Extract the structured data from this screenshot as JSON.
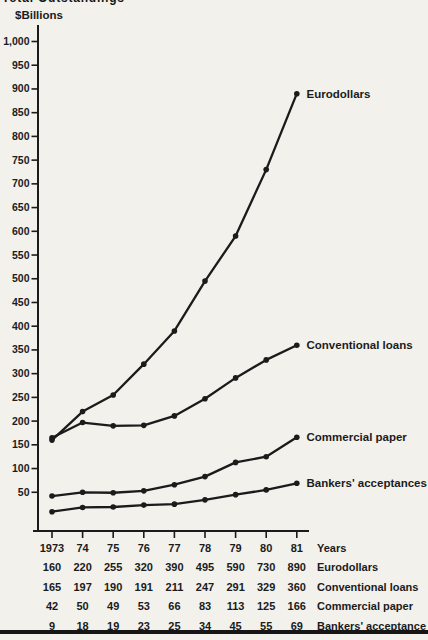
{
  "page": {
    "clipped_title": "Total Outstandings",
    "background_color": "#f2f1ec",
    "ink_color": "#1c1c1c"
  },
  "chart_data": {
    "type": "line",
    "title": "Total Outstandings",
    "ylabel": "$Billions",
    "xlabel": "Years",
    "categories": [
      "1973",
      "74",
      "75",
      "76",
      "77",
      "78",
      "79",
      "80",
      "81"
    ],
    "series": [
      {
        "name": "Eurodollars",
        "values": [
          160,
          220,
          255,
          320,
          390,
          495,
          590,
          730,
          890
        ]
      },
      {
        "name": "Conventional loans",
        "values": [
          165,
          197,
          190,
          191,
          211,
          247,
          291,
          329,
          360
        ]
      },
      {
        "name": "Commercial paper",
        "values": [
          42,
          50,
          49,
          53,
          66,
          83,
          113,
          125,
          166
        ]
      },
      {
        "name": "Bankers' acceptances",
        "values": [
          9,
          18,
          19,
          23,
          25,
          34,
          45,
          55,
          69
        ]
      }
    ],
    "ylim": [
      0,
      1000
    ],
    "ytick_step": 50,
    "ytick_top_label": "1,000",
    "grid": false,
    "legend_position": "labels-at-line-ends",
    "line_color": "#1b1b1b"
  },
  "table": {
    "rows": [
      {
        "label": "Years",
        "values": [
          "1973",
          "74",
          "75",
          "76",
          "77",
          "78",
          "79",
          "80",
          "81"
        ]
      },
      {
        "label": "Eurodollars",
        "values": [
          "160",
          "220",
          "255",
          "320",
          "390",
          "495",
          "590",
          "730",
          "890"
        ]
      },
      {
        "label": "Conventional loans",
        "values": [
          "165",
          "197",
          "190",
          "191",
          "211",
          "247",
          "291",
          "329",
          "360"
        ]
      },
      {
        "label": "Commercial paper",
        "values": [
          "42",
          "50",
          "49",
          "53",
          "66",
          "83",
          "113",
          "125",
          "166"
        ]
      },
      {
        "label": "Bankers' acceptance",
        "values": [
          "9",
          "18",
          "19",
          "23",
          "25",
          "34",
          "45",
          "55",
          "69"
        ]
      }
    ]
  }
}
